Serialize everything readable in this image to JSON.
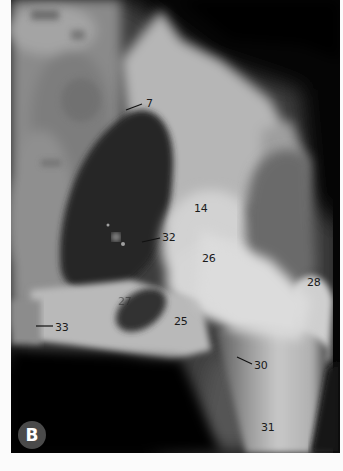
{
  "figure": {
    "panel_letter": "B",
    "labels": [
      {
        "id": "7",
        "text": "7",
        "x": 135,
        "y": 98,
        "leader": true
      },
      {
        "id": "14",
        "text": "14",
        "x": 183,
        "y": 203,
        "leader": false
      },
      {
        "id": "32",
        "text": "32",
        "x": 151,
        "y": 232,
        "leader": true
      },
      {
        "id": "26",
        "text": "26",
        "x": 191,
        "y": 253,
        "leader": false
      },
      {
        "id": "27",
        "text": "27",
        "x": 107,
        "y": 296,
        "leader": false
      },
      {
        "id": "28",
        "text": "28",
        "x": 296,
        "y": 277,
        "leader": false
      },
      {
        "id": "25",
        "text": "25",
        "x": 163,
        "y": 316,
        "leader": false
      },
      {
        "id": "33",
        "text": "33",
        "x": 44,
        "y": 322,
        "leader": true
      },
      {
        "id": "30",
        "text": "30",
        "x": 243,
        "y": 360,
        "leader": true
      },
      {
        "id": "31",
        "text": "31",
        "x": 250,
        "y": 422,
        "leader": false
      }
    ]
  },
  "colors": {
    "background": "#fbfbfb",
    "film_dark": "#050505",
    "bone_light": "#d8d8d8",
    "badge": "#4a4a4a",
    "label_text": "#1a1a1a"
  }
}
